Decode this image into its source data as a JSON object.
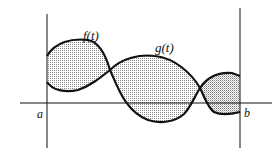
{
  "diagram": {
    "curves": [
      {
        "name": "f",
        "label": "f(t)"
      },
      {
        "name": "g",
        "label": "g(t)"
      }
    ],
    "bounds": {
      "left_label": "a",
      "right_label": "b"
    },
    "colors": {
      "stroke": "#111111",
      "shade": "#9a9a9a",
      "background": "#ffffff"
    }
  }
}
